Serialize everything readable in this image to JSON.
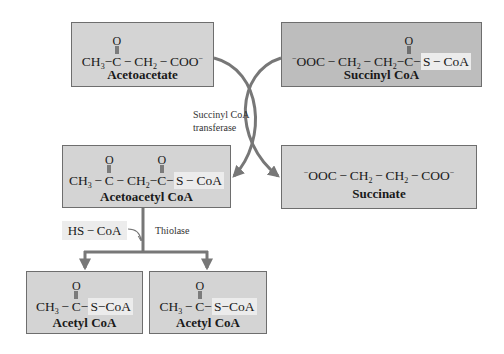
{
  "diagram": {
    "nodes": {
      "acetoacetate": {
        "name": "Acetoacetate",
        "formula": [
          "CH3",
          "C(=O)",
          "CH2",
          "COO-"
        ]
      },
      "succinyl_coa": {
        "name": "Succinyl CoA",
        "formula": [
          "-OOC",
          "CH2",
          "CH2",
          "C(=O)",
          "S",
          "CoA"
        ]
      },
      "acetoacetyl_coa": {
        "name": "Acetoacetyl CoA",
        "formula": [
          "CH3",
          "C(=O)",
          "CH2",
          "C(=O)",
          "S",
          "CoA"
        ]
      },
      "succinate": {
        "name": "Succinate",
        "formula": [
          "-OOC",
          "CH2",
          "CH2",
          "COO-"
        ]
      },
      "acetyl_coa_1": {
        "name": "Acetyl CoA",
        "formula": [
          "CH3",
          "C(=O)",
          "S",
          "CoA"
        ]
      },
      "acetyl_coa_2": {
        "name": "Acetyl CoA",
        "formula": [
          "CH3",
          "C(=O)",
          "S",
          "CoA"
        ]
      }
    },
    "enzymes": {
      "transferase_line1": "Succinyl CoA",
      "transferase_line2": "transferase",
      "thiolase": "Thiolase"
    },
    "cofactor": {
      "hs_coa": "HS − CoA"
    },
    "edges": [
      {
        "from": "acetoacetate",
        "to": "acetoacetyl_coa",
        "enzyme": "Succinyl CoA transferase"
      },
      {
        "from": "succinyl_coa",
        "to": "succinate",
        "enzyme": "Succinyl CoA transferase"
      },
      {
        "from": "acetoacetyl_coa",
        "to": "acetyl_coa_1",
        "enzyme": "Thiolase"
      },
      {
        "from": "acetoacetyl_coa",
        "to": "acetyl_coa_2",
        "enzyme": "Thiolase"
      }
    ],
    "symbols": {
      "ch3": "CH",
      "ch2": "CH",
      "c": "C",
      "o": "O",
      "s": "S",
      "coa": "CoA",
      "coo": "COO",
      "ooc": "OOC",
      "minus": "−",
      "dash": " − ",
      "sub3": "3",
      "sub2": "2",
      "neg": "−"
    },
    "colors": {
      "box_light": "#d4d4d4",
      "box_dark": "#bdbdbd",
      "arrow": "#777777",
      "highlight": "#ececec"
    }
  }
}
